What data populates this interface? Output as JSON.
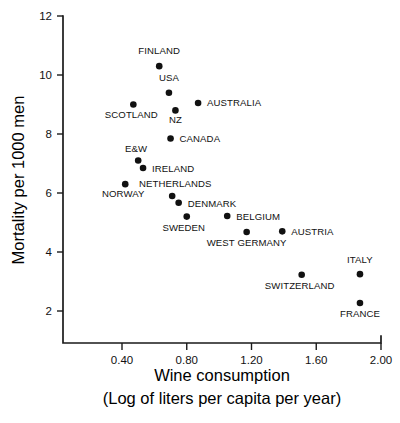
{
  "chart_data": {
    "type": "scatter",
    "title": "",
    "xlabel": "Wine consumption",
    "xlabel_line2": "(Log of liters per capita per year)",
    "ylabel": "Mortality per 1000 men",
    "xlim": [
      0.2,
      2.0
    ],
    "ylim": [
      1.0,
      12.0
    ],
    "xticks": [
      "0.40",
      "0.80",
      "1.20",
      "1.60",
      "2.00"
    ],
    "xtick_values": [
      0.4,
      0.8,
      1.2,
      1.6,
      2.0
    ],
    "yticks": [
      "12",
      "10",
      "8",
      "6",
      "4",
      "2"
    ],
    "ytick_values": [
      12,
      10,
      8,
      6,
      4,
      2
    ],
    "grid": false,
    "legend": "none",
    "marker": "filled-circle",
    "marker_color": "#111111",
    "points": [
      {
        "label": "FINLAND",
        "x": 0.63,
        "y": 10.3,
        "label_dx": 0,
        "label_dy": -12,
        "anchor": "middle"
      },
      {
        "label": "USA",
        "x": 0.69,
        "y": 9.4,
        "label_dx": 0,
        "label_dy": -12,
        "anchor": "middle"
      },
      {
        "label": "SCOTLAND",
        "x": 0.47,
        "y": 9.0,
        "label_dx": -2,
        "label_dy": 13,
        "anchor": "middle"
      },
      {
        "label": "AUSTRALIA",
        "x": 0.87,
        "y": 9.05,
        "label_dx": 9,
        "label_dy": 3,
        "anchor": "start"
      },
      {
        "label": "NZ",
        "x": 0.73,
        "y": 8.8,
        "label_dx": 0,
        "label_dy": 13,
        "anchor": "middle"
      },
      {
        "label": "CANADA",
        "x": 0.7,
        "y": 7.85,
        "label_dx": 9,
        "label_dy": 4,
        "anchor": "start"
      },
      {
        "label": "E&W",
        "x": 0.5,
        "y": 7.1,
        "label_dx": -2,
        "label_dy": -9,
        "anchor": "middle"
      },
      {
        "label": "IRELAND",
        "x": 0.53,
        "y": 6.85,
        "label_dx": 9,
        "label_dy": 4,
        "anchor": "start"
      },
      {
        "label": "NORWAY",
        "x": 0.42,
        "y": 6.3,
        "label_dx": -2,
        "label_dy": 13,
        "anchor": "middle"
      },
      {
        "label": "NETHERLANDS",
        "x": 0.71,
        "y": 5.9,
        "label_dx": 3,
        "label_dy": -9,
        "anchor": "middle"
      },
      {
        "label": "DENMARK",
        "x": 0.75,
        "y": 5.67,
        "label_dx": 9,
        "label_dy": 4,
        "anchor": "start"
      },
      {
        "label": "SWEDEN",
        "x": 0.8,
        "y": 5.2,
        "label_dx": -3,
        "label_dy": 14,
        "anchor": "middle"
      },
      {
        "label": "BELGIUM",
        "x": 1.05,
        "y": 5.22,
        "label_dx": 9,
        "label_dy": 4,
        "anchor": "start"
      },
      {
        "label": "WEST GERMANY",
        "x": 1.17,
        "y": 4.68,
        "label_dx": 0,
        "label_dy": 14,
        "anchor": "middle"
      },
      {
        "label": "AUSTRIA",
        "x": 1.39,
        "y": 4.7,
        "label_dx": 9,
        "label_dy": 4,
        "anchor": "start"
      },
      {
        "label": "ITALY",
        "x": 1.87,
        "y": 3.25,
        "label_dx": 0,
        "label_dy": -11,
        "anchor": "middle"
      },
      {
        "label": "SWITZERLAND",
        "x": 1.51,
        "y": 3.23,
        "label_dx": -2,
        "label_dy": 14,
        "anchor": "middle"
      },
      {
        "label": "FRANCE",
        "x": 1.87,
        "y": 2.27,
        "label_dx": 0,
        "label_dy": 14,
        "anchor": "middle"
      }
    ]
  }
}
